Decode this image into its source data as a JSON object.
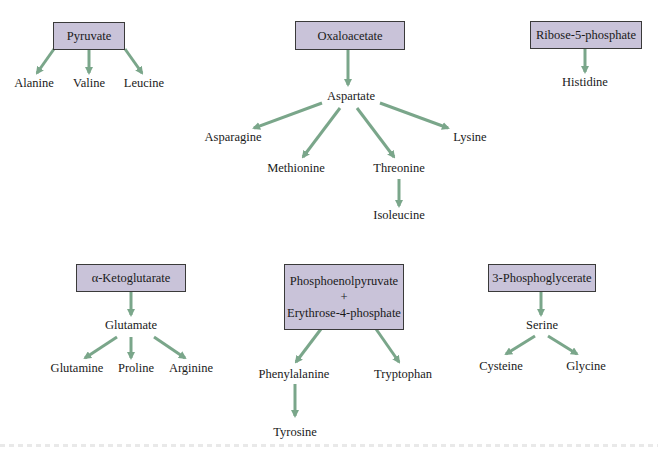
{
  "diagram": {
    "type": "biosynthetic-pathway-tree",
    "arrow_color": "#7aa68a",
    "box_color": "#c9c3d9",
    "groups": [
      {
        "precursor": "Pyruvate",
        "products": [
          "Alanine",
          "Valine",
          "Leucine"
        ]
      },
      {
        "precursor": "Oxaloacetate",
        "intermediate": "Aspartate",
        "products": [
          "Asparagine",
          "Methionine",
          "Threonine",
          "Lysine"
        ],
        "sub": {
          "from": "Threonine",
          "to": "Isoleucine"
        }
      },
      {
        "precursor": "Ribose-5-phosphate",
        "products": [
          "Histidine"
        ]
      },
      {
        "precursor": "α-Ketoglutarate",
        "intermediate": "Glutamate",
        "products": [
          "Glutamine",
          "Proline",
          "Arginine"
        ]
      },
      {
        "precursor_lines": [
          "Phosphoenolpyruvate",
          "+",
          "Erythrose-4-phosphate"
        ],
        "products": [
          "Phenylalanine",
          "Tryptophan"
        ],
        "sub": {
          "from": "Phenylalanine",
          "to": "Tyrosine"
        }
      },
      {
        "precursor": "3-Phosphoglycerate",
        "intermediate": "Serine",
        "products": [
          "Cysteine",
          "Glycine"
        ]
      }
    ]
  }
}
